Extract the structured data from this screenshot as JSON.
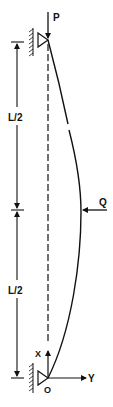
{
  "diagram": {
    "type": "column-buckling-free-body",
    "labels": {
      "axial_load": "P",
      "lateral_load": "Q",
      "half_length_top": "L/2",
      "half_length_bottom": "L/2",
      "axis_x": "X",
      "axis_y": "Y",
      "origin": "O"
    },
    "colors": {
      "line": "#111111",
      "background": "#ffffff"
    }
  }
}
